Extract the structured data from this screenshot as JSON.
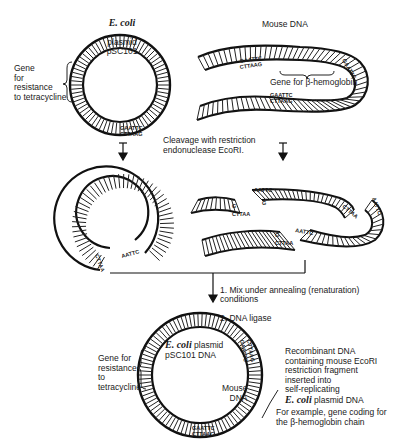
{
  "diagram": {
    "type": "recombinant-dna-construction",
    "top": {
      "plasmid": {
        "title_italic": "E. coli",
        "title": "plasmid pSC101",
        "gene_label": "Gene\nfor\nresistance\nto tetracycline"
      },
      "mouse_dna": {
        "title": "Mouse DNA",
        "gene_label": "Gene for β-hemoglobin",
        "sites": [
          {
            "top": "GAATTC",
            "bottom": "CTTAAG"
          },
          {
            "top": "GAATTC",
            "bottom": "CTTAAG"
          },
          {
            "top": "GAATTC",
            "bottom": "CTTAAG"
          }
        ]
      },
      "plasmid_site": {
        "top": "GAATTC",
        "bottom": "CTTAAG"
      }
    },
    "step1": {
      "label": "Cleavage with restriction\nendonuclease EcoRI."
    },
    "middle": {
      "sticky_end_top": "AATTC",
      "sticky_end_g": "G",
      "sticky_end_bottom": "CTTAA"
    },
    "step2": {
      "items": [
        "1.  Mix under annealing (renaturation) conditions",
        "2.  DNA ligase"
      ]
    },
    "bottom": {
      "plasmid_title_italic": "E. coli",
      "plasmid_title": " plasmid\npSC101 DNA",
      "gene_label": "Gene for\nresistance\nto\ntetracycline",
      "mouse_label": "Mouse\nDNA",
      "recombinant_label_1": "Recombinant DNA\ncontaining mouse EcoRI\nrestriction fragment\ninserted into\nself-replicating",
      "recombinant_label_italic": "E. coli",
      "recombinant_label_2": " plasmid DNA",
      "example_label": "For example, gene coding for\nthe β-hemoglobin chain",
      "site_top": "GAATTC",
      "site_bottom": "CTTAAG"
    }
  }
}
